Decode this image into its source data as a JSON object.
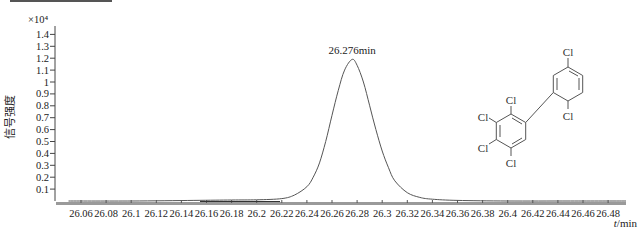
{
  "chart_data": {
    "type": "line",
    "title": "",
    "xlabel": "t/min",
    "xlabel_italic_part": "t",
    "xlabel_unit": "/min",
    "ylabel": "信号强度",
    "y_multiplier": "×10⁴",
    "xlim": [
      26.05,
      26.5
    ],
    "ylim": [
      0,
      1.45
    ],
    "grid": false,
    "legend": null,
    "x_ticks": [
      "26.06",
      "26.08",
      "26.1",
      "26.12",
      "26.14",
      "26.16",
      "26.18",
      "26.2",
      "26.22",
      "26.24",
      "26.26",
      "26.28",
      "26.3",
      "26.32",
      "26.34",
      "26.36",
      "26.38",
      "26.4",
      "26.42",
      "26.44",
      "26.46",
      "26.48"
    ],
    "y_ticks": [
      "0.1",
      "0.2",
      "0.3",
      "0.4",
      "0.5",
      "0.6",
      "0.7",
      "0.8",
      "0.9",
      "1",
      "1.1",
      "1.2",
      "1.3",
      "1.4"
    ],
    "annotation": {
      "text": "26.276min",
      "x": 26.276,
      "y": 1.19
    },
    "series": [
      {
        "name": "signal",
        "x": [
          26.05,
          26.1,
          26.15,
          26.18,
          26.2,
          26.22,
          26.23,
          26.24,
          26.245,
          26.25,
          26.255,
          26.26,
          26.265,
          26.27,
          26.276,
          26.28,
          26.285,
          26.29,
          26.295,
          26.3,
          26.305,
          26.31,
          26.32,
          26.33,
          26.34,
          26.36,
          26.4,
          26.45,
          26.5
        ],
        "values": [
          0.0,
          0.0,
          0.005,
          0.008,
          0.01,
          0.02,
          0.05,
          0.12,
          0.2,
          0.32,
          0.5,
          0.72,
          0.93,
          1.1,
          1.19,
          1.14,
          1.0,
          0.8,
          0.6,
          0.42,
          0.28,
          0.17,
          0.07,
          0.03,
          0.015,
          0.005,
          0.0,
          0.0,
          0.0
        ]
      }
    ]
  },
  "molecule": {
    "name": "PCB congener",
    "substituents": [
      "Cl",
      "Cl",
      "Cl",
      "Cl",
      "Cl",
      "Cl"
    ]
  }
}
